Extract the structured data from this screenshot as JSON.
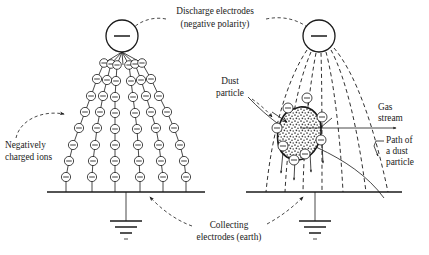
{
  "figure": {
    "background_color": "#ffffff",
    "ink_color": "#1a1a1a"
  },
  "labels": {
    "discharge_line1": "Discharge electrodes",
    "discharge_line2": "(negative polarity)",
    "negatively_charged_line1": "Negatively",
    "negatively_charged_line2": "charged ions",
    "dust_particle_line1": "Dust",
    "dust_particle_line2": "particle",
    "gas_stream_line1": "Gas",
    "gas_stream_line2": "stream",
    "path_line1": "Path of",
    "path_line2": "a dust",
    "path_line3": "particle",
    "collecting_line1": "Collecting",
    "collecting_line2": "electrodes (earth)"
  },
  "symbols": {
    "electrode_charge_sign": "minus",
    "ion_charge_sign": "minus",
    "ground_symbol": "earth"
  },
  "left_panel": {
    "electrode": {
      "cx": 122,
      "cy": 36,
      "r": 16
    },
    "baseline": {
      "x1": 47,
      "x2": 205,
      "y": 192
    },
    "ground_stem": {
      "x": 126,
      "y1": 192,
      "y2": 221
    },
    "ion_chain_count": 6,
    "ions_per_chain": [
      7,
      8,
      8,
      8,
      8,
      7
    ],
    "chain_bottom_x": [
      66,
      92,
      115,
      140,
      163,
      186
    ]
  },
  "right_panel": {
    "electrode": {
      "cx": 319,
      "cy": 36,
      "r": 16
    },
    "baseline": {
      "x1": 246,
      "x2": 402,
      "y": 192
    },
    "ground_stem": {
      "x": 315,
      "y1": 192,
      "y2": 221
    },
    "field_line_count": 7,
    "particle": {
      "cx": 300,
      "cy": 133,
      "rx": 20,
      "ry": 25
    },
    "surrounding_ion_count": 8,
    "gas_stream_arrow": {
      "x1": 300,
      "x2": 396,
      "y": 128
    }
  }
}
